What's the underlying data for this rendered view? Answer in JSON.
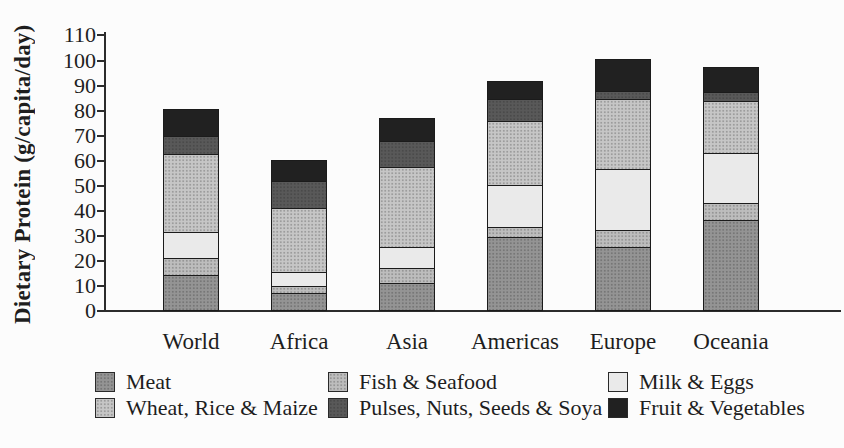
{
  "chart_data": {
    "type": "bar",
    "stacked": true,
    "title": "",
    "xlabel": "",
    "ylabel": "Dietary Protein (g/capita/day)",
    "ylim": [
      0,
      110
    ],
    "ytick_step": 10,
    "yticks": [
      0,
      10,
      20,
      30,
      40,
      50,
      60,
      70,
      80,
      90,
      100,
      110
    ],
    "grid": false,
    "legend_position": "bottom",
    "legend_rows": 2,
    "categories": [
      "World",
      "Africa",
      "Asia",
      "Americas",
      "Europe",
      "Oceania"
    ],
    "series": [
      {
        "name": "Meat",
        "color": "#949494",
        "pattern": "halftone",
        "values": [
          14.5,
          7,
          11,
          29.5,
          25.5,
          36.5
        ]
      },
      {
        "name": "Fish & Seafood",
        "color": "#bdbdbd",
        "pattern": "halftone",
        "values": [
          6.5,
          3,
          6,
          4,
          7,
          6.5
        ]
      },
      {
        "name": "Milk & Eggs",
        "color": "#eaeaea",
        "pattern": "solid",
        "values": [
          10.5,
          5.5,
          8.5,
          17,
          24,
          20
        ]
      },
      {
        "name": "Wheat, Rice & Maize",
        "color": "#c6c6c6",
        "pattern": "halftone",
        "values": [
          31,
          25.5,
          32,
          25.5,
          28,
          21
        ]
      },
      {
        "name": "Pulses, Nuts, Seeds & Soya",
        "color": "#595959",
        "pattern": "halftone",
        "values": [
          7.5,
          11,
          10.5,
          8.5,
          3.5,
          3.5
        ]
      },
      {
        "name": "Fruit & Vegetables",
        "color": "#212121",
        "pattern": "solid",
        "values": [
          10.5,
          8.5,
          9,
          7.5,
          12.5,
          10
        ]
      }
    ],
    "stack_order_bottom_to_top": [
      "Meat",
      "Fish & Seafood",
      "Milk & Eggs",
      "Wheat, Rice & Maize",
      "Pulses, Nuts, Seeds & Soya",
      "Fruit & Vegetables"
    ],
    "totals": [
      80.5,
      60.5,
      77,
      92,
      100.5,
      97.5
    ]
  },
  "axis_color": "#2c2c2c"
}
